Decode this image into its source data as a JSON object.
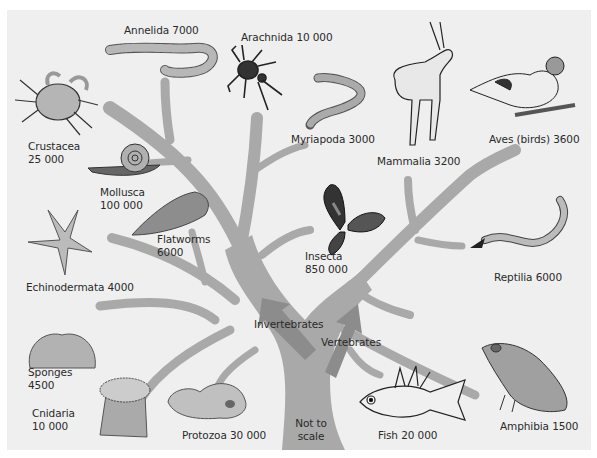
{
  "diagram": {
    "branch_labels": {
      "invertebrates": "Invertebrates",
      "vertebrates": "Vertebrates"
    },
    "note": {
      "line1": "Not to",
      "line2": "scale"
    },
    "colors": {
      "background": "#efefef",
      "tree": "#a9a9a9",
      "arrow": "#8c8c8c",
      "text": "#2a2a2a"
    },
    "groups": [
      {
        "id": "annelida",
        "name": "Annelida",
        "count": "7000",
        "icon": "earthworm-icon",
        "branch": "invertebrates"
      },
      {
        "id": "arachnida",
        "name": "Arachnida",
        "count": "10 000",
        "icon": "spider-icon",
        "branch": "invertebrates"
      },
      {
        "id": "myriapoda",
        "name": "Myriapoda",
        "count": "3000",
        "icon": "centipede-icon",
        "branch": "invertebrates"
      },
      {
        "id": "crustacea",
        "name": "Crustacea",
        "count": "25 000",
        "icon": "crab-icon",
        "branch": "invertebrates"
      },
      {
        "id": "mollusca",
        "name": "Mollusca",
        "count": "100 000",
        "icon": "snail-icon",
        "branch": "invertebrates"
      },
      {
        "id": "flatworms",
        "name": "Flatworms",
        "count": "6000",
        "icon": "flatworm-icon",
        "branch": "invertebrates"
      },
      {
        "id": "echinodermata",
        "name": "Echinodermata",
        "count": "4000",
        "icon": "starfish-icon",
        "branch": "invertebrates"
      },
      {
        "id": "insecta",
        "name": "Insecta",
        "count": "850 000",
        "icon": "butterfly-icon",
        "branch": "invertebrates"
      },
      {
        "id": "sponges",
        "name": "Sponges",
        "count": "4500",
        "icon": "sponge-icon",
        "branch": "invertebrates"
      },
      {
        "id": "cnidaria",
        "name": "Cnidaria",
        "count": "10 000",
        "icon": "sea-anemone-icon",
        "branch": "invertebrates"
      },
      {
        "id": "protozoa",
        "name": "Protozoa",
        "count": "30 000",
        "icon": "amoeba-icon",
        "branch": "invertebrates"
      },
      {
        "id": "mammalia",
        "name": "Mammalia",
        "count": "3200",
        "icon": "gazelle-icon",
        "branch": "vertebrates"
      },
      {
        "id": "aves",
        "name": "Aves (birds)",
        "count": "3600",
        "icon": "bird-icon",
        "branch": "vertebrates"
      },
      {
        "id": "reptilia",
        "name": "Reptilia",
        "count": "6000",
        "icon": "snake-icon",
        "branch": "vertebrates"
      },
      {
        "id": "amphibia",
        "name": "Amphibia",
        "count": "1500",
        "icon": "frog-icon",
        "branch": "vertebrates"
      },
      {
        "id": "fish",
        "name": "Fish",
        "count": "20 000",
        "icon": "fish-icon",
        "branch": "vertebrates"
      }
    ]
  }
}
